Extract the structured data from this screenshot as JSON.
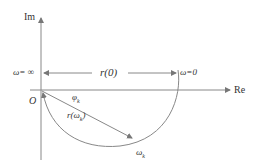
{
  "diagram": {
    "axes": {
      "y_label": "Im",
      "x_label": "Re",
      "origin_label": "O"
    },
    "dimension": {
      "left_label": "ω= ∞",
      "center_label": "r(0)",
      "right_label": "ω=0"
    },
    "curve": {
      "angle_label": "φk",
      "angle_base": "φ",
      "angle_sub": "k",
      "radius_base": "r(ω",
      "radius_sub": "k",
      "radius_close": ")",
      "point_base": "ω",
      "point_sub": "k"
    },
    "colors": {
      "line": "#888888",
      "text": "#333333",
      "background": "#ffffff"
    }
  }
}
